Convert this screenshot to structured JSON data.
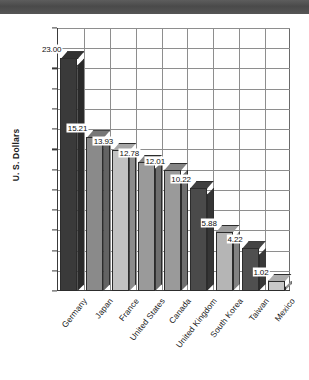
{
  "chart_data": {
    "type": "bar",
    "title": "",
    "xlabel": "",
    "ylabel": "U. S. Dollars",
    "ylim": [
      0,
      26
    ],
    "ytick_step": 2,
    "yticks": [
      26,
      24,
      22,
      20,
      18,
      16,
      14,
      12,
      10,
      8,
      6,
      4,
      2,
      0
    ],
    "grid": "both",
    "legend": "none",
    "style": "3d-bars-grayscale",
    "categories": [
      "Germany",
      "Japan",
      "France",
      "United States",
      "Canada",
      "United Kingdom",
      "South Korea",
      "Taiwan",
      "Mexico"
    ],
    "values": [
      23.0,
      15.21,
      13.93,
      12.78,
      12.01,
      10.22,
      5.88,
      4.22,
      1.02
    ],
    "data_labels": [
      "23.00",
      "15.21",
      "13.93",
      "12.78",
      "12.01",
      "10.22",
      "5.88",
      "4.22",
      "1.02"
    ],
    "bar_colors": [
      "#3a3a3a",
      "#8a8a8a",
      "#c2c2c2",
      "#9a9a9a",
      "#9a9a9a",
      "#4a4a4a",
      "#b5b5b5",
      "#4f4f4f",
      "#c8c8c8"
    ]
  },
  "colors": {
    "banner": "#525252",
    "grid": "#8e8e8e",
    "axis": "#3a3a3a",
    "text": "#111111",
    "background": "#ffffff"
  }
}
